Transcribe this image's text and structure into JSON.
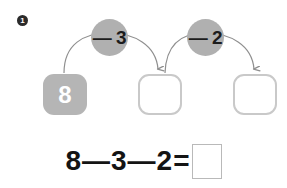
{
  "page": {
    "background": "#ffffff",
    "item_number": "1"
  },
  "colors": {
    "marker_fill": "#2b2b2b",
    "marker_text": "#ffffff",
    "circle_fill": "#b0b0b0",
    "circle_text": "#1c1c1c",
    "filled_box_fill": "#b5b5b5",
    "filled_box_text": "#ffffff",
    "empty_box_border": "#c9c9c9",
    "arrow_stroke": "#8f8f8f",
    "equation_text": "#141414",
    "answer_box_border": "#b9b9b9"
  },
  "chain": {
    "start_box": {
      "value": "8",
      "state": "filled"
    },
    "steps": [
      {
        "operator_label": "— 3",
        "target_box": {
          "value": "",
          "state": "empty"
        }
      },
      {
        "operator_label": "— 2",
        "target_box": {
          "value": "",
          "state": "empty"
        }
      }
    ]
  },
  "equation": {
    "terms": [
      "8",
      "3",
      "2"
    ],
    "operators": [
      "—",
      "—"
    ],
    "equals": "=",
    "answer": ""
  },
  "icons": {
    "arrow_1": "curved-arrow-icon",
    "arrow_2": "curved-arrow-icon"
  }
}
